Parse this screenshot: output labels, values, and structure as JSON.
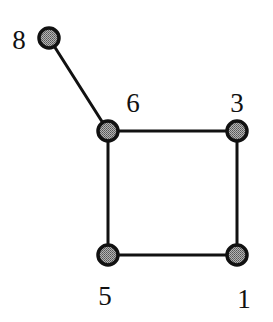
{
  "diagram": {
    "type": "undirected-graph",
    "colors": {
      "background": "#ffffff",
      "edge": "#111111",
      "node_outline": "#111111",
      "node_fill": "#8c8c8c"
    },
    "node_radius": 10,
    "nodes": [
      {
        "id": "8",
        "label": "8",
        "x": 49,
        "y": 38,
        "label_x": 19,
        "label_y": 49
      },
      {
        "id": "6",
        "label": "6",
        "x": 108,
        "y": 131,
        "label_x": 133,
        "label_y": 112
      },
      {
        "id": "3",
        "label": "3",
        "x": 237,
        "y": 131,
        "label_x": 237,
        "label_y": 112
      },
      {
        "id": "5",
        "label": "5",
        "x": 108,
        "y": 255,
        "label_x": 105,
        "label_y": 305
      },
      {
        "id": "1",
        "label": "1",
        "x": 237,
        "y": 255,
        "label_x": 244,
        "label_y": 308
      }
    ],
    "edges": [
      {
        "from": "8",
        "to": "6"
      },
      {
        "from": "6",
        "to": "3"
      },
      {
        "from": "6",
        "to": "5"
      },
      {
        "from": "3",
        "to": "1"
      },
      {
        "from": "5",
        "to": "1"
      }
    ]
  }
}
